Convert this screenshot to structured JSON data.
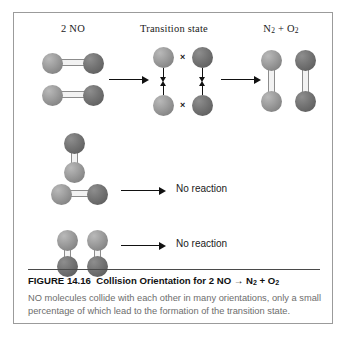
{
  "figure": {
    "column_labels": {
      "reactants": "2 NO",
      "transition_state": "Transition state",
      "products_prefix": "N",
      "products_sub1": "2",
      "products_mid": " + O",
      "products_sub2": "2"
    },
    "rows": [
      {
        "name": "productive-collision",
        "result": "",
        "description": "Two NO molecules aligned horizontally collide to form the transition state, then N2 + O2"
      },
      {
        "name": "unproductive-collision-1",
        "result": "No reaction",
        "description": "One vertical NO molecule above one horizontal NO molecule"
      },
      {
        "name": "unproductive-collision-2",
        "result": "No reaction",
        "description": "Two vertical NO molecules side by side"
      }
    ],
    "atoms": {
      "nitrogen_label": "N",
      "oxygen_label": "O",
      "nitrogen_color": "#9d9d9d",
      "oxygen_color": "#757575"
    },
    "bond_break_mark": "×",
    "caption": {
      "figure_number": "FIGURE 14.16",
      "title_text": "Collision Orientation for 2 NO",
      "title_arrow": "→",
      "title_product_n": "N",
      "title_product_n_sub": "2",
      "title_plus": " + O",
      "title_product_o_sub": "2",
      "body": "NO molecules collide with each other in many orientations, only a small percentage of which lead to the formation of the transition state."
    },
    "colors": {
      "frame_border": "#9b9b9b",
      "background": "#ffffff",
      "caption_body_text": "#6d6d6d",
      "caption_title_text": "#111111",
      "arrow": "#111111"
    }
  }
}
